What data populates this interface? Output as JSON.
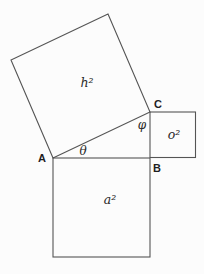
{
  "figure": {
    "vertices": {
      "a": "A",
      "b": "B",
      "c": "C"
    },
    "angles": {
      "theta": "θ",
      "phi": "φ"
    },
    "squares": {
      "hypotenuse_label": "h²",
      "opposite_label": "o²",
      "adjacent_label": "a²"
    },
    "colors": {
      "stroke": "#555555",
      "background": "#fcfcfc"
    }
  }
}
